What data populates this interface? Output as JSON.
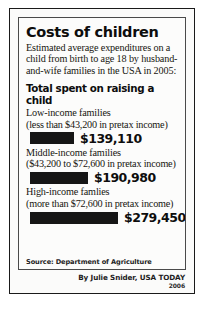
{
  "headline": "Costs of children",
  "standfirst": "Estimated average expenditures on a child from birth to age 18 by husband-and-wife families in the USA in 2005:",
  "section_title": "Total spent on raising a child",
  "groups": [
    {
      "label": "Low-income families",
      "qualifier": "(less than $43,200 in pretax income)",
      "value_label": "$139,110",
      "value": 139110,
      "bar_width_px": 44
    },
    {
      "label": "Middle-income families",
      "qualifier": "($43,200 to $72,600 in pretax income)",
      "value_label": "$190,980",
      "value": 190980,
      "bar_width_px": 58
    },
    {
      "label": "High-income famlies",
      "qualifier": "(more than $72,600 in pretax income)",
      "value_label": "$279,450",
      "value": 279450,
      "bar_width_px": 88
    }
  ],
  "source": "Source: Department of Agriculture",
  "byline": "By Julie Snider, USA TODAY",
  "year": "2006",
  "colors": {
    "bar": "#161616",
    "text": "#111111",
    "frame": "#1a1a1a",
    "background": "#fbfbfa"
  },
  "chart_data": {
    "type": "bar",
    "title": "Total spent on raising a child",
    "categories": [
      "Low-income families (less than $43,200 in pretax income)",
      "Middle-income families ($43,200 to $72,600 in pretax income)",
      "High-income famlies (more than $72,600 in pretax income)"
    ],
    "values": [
      139110,
      190980,
      279450
    ],
    "value_labels": [
      "$139,110",
      "$190,980",
      "$279,450"
    ],
    "xlabel": "",
    "ylabel": "",
    "xlim": [
      0,
      279450
    ],
    "orientation": "horizontal",
    "grid": false,
    "legend": false
  }
}
